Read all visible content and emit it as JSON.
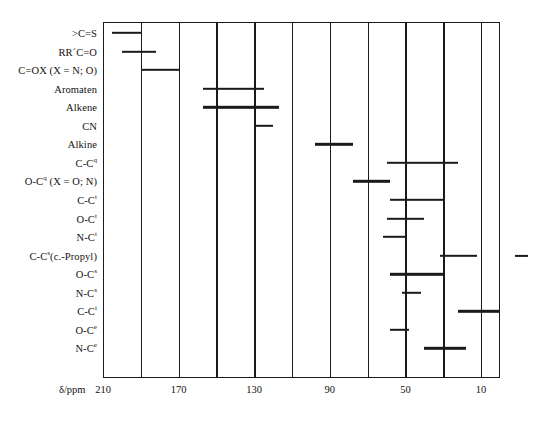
{
  "chart_data": {
    "type": "bar",
    "title": "",
    "subtitle": "",
    "xlabel": "δ/ppm",
    "ylabel": "",
    "xlim": [
      210,
      0
    ],
    "x_axis_reversed": true,
    "grid": true,
    "grid_spacing": 20,
    "legend": "none",
    "tick_values": [
      210,
      190,
      170,
      150,
      130,
      110,
      90,
      70,
      50,
      30,
      10
    ],
    "tick_labels": [
      "210",
      "",
      "170",
      "",
      "130",
      "",
      "90",
      "",
      "50",
      "",
      "10"
    ],
    "orientation": "horizontal-ranges",
    "categories": [
      ">C=S",
      "RR´C=O",
      "C=OX (X = N; O)",
      "Aromaten",
      "Alkene",
      "CN",
      "Alkine",
      "C-Cᵖ",
      "O-Cᵖ (X = O; N)",
      "C-Cᵗ",
      "O-Cᵗ",
      "N-Cᵗ",
      "C-Cᵛ(c.-Propyl)",
      "O-Cᵈ",
      "N-Cᵈ",
      "C-Cᶠ",
      "O-Cᵉ",
      "N-Cᵉ"
    ],
    "rows": [
      {
        "label_base": ">C=S",
        "label_sup": "",
        "label_tail": "",
        "start": 205,
        "end": 190
      },
      {
        "label_base": "RR´C=O",
        "label_sup": "",
        "label_tail": "",
        "start": 200,
        "end": 182
      },
      {
        "label_base": "C=OX",
        "label_sup": "",
        "label_tail": " (X = N; O)",
        "start": 190,
        "end": 170
      },
      {
        "label_base": "Aromaten",
        "label_sup": "",
        "label_tail": "",
        "start": 157,
        "end": 125
      },
      {
        "label_base": "Alkene",
        "label_sup": "",
        "label_tail": "",
        "start": 157,
        "end": 117
      },
      {
        "label_base": "CN",
        "label_sup": "",
        "label_tail": "",
        "start": 130,
        "end": 120
      },
      {
        "label_base": "Alkine",
        "label_sup": "",
        "label_tail": "",
        "start": 98,
        "end": 78
      },
      {
        "label_base": "C-C",
        "label_sup": "q",
        "label_tail": "",
        "start": 60,
        "end": 22
      },
      {
        "label_base": "O-C",
        "label_sup": "q",
        "label_tail": " (X = O; N)",
        "start": 78,
        "end": 58
      },
      {
        "label_base": "C-C",
        "label_sup": "t",
        "label_tail": "",
        "start": 58,
        "end": 30
      },
      {
        "label_base": "O-C",
        "label_sup": "t",
        "label_tail": "",
        "start": 60,
        "end": 40
      },
      {
        "label_base": "N-C",
        "label_sup": "t",
        "label_tail": "",
        "start": 62,
        "end": 50
      },
      {
        "label_base": "C-C",
        "label_sup": "s",
        "label_tail": "(c.-Propyl)",
        "start": 32,
        "end": 12
      },
      {
        "label_base": "O-C",
        "label_sup": "s",
        "label_tail": "",
        "start": 58,
        "end": 30
      },
      {
        "label_base": "N-C",
        "label_sup": "s",
        "label_tail": "",
        "start": 52,
        "end": 42
      },
      {
        "label_base": "C-C",
        "label_sup": "i",
        "label_tail": "",
        "start": 22,
        "end": 0
      },
      {
        "label_base": "O-C",
        "label_sup": "e",
        "label_tail": "",
        "start": 58,
        "end": 48
      },
      {
        "label_base": "N-C",
        "label_sup": "e",
        "label_tail": "",
        "start": 40,
        "end": 18
      }
    ],
    "outside_mark": {
      "present": true,
      "note": "short dash right of plot frame"
    }
  }
}
